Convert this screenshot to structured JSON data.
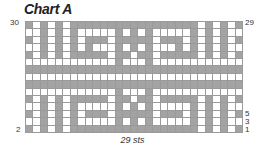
{
  "title": "Chart A",
  "labels": {
    "left_top": "30",
    "left_bottom": "2",
    "right_top": "29",
    "right_5": "5",
    "right_3": "3",
    "right_1": "1"
  },
  "footer": "29 sts",
  "colors": {
    "contrast": "#a3a3a3",
    "main": "#ffffff",
    "gridline": "#9a9a9a"
  },
  "chart_data": {
    "type": "heatmap",
    "title": "Chart A",
    "xlabel": "29 sts",
    "columns": 29,
    "rows": 15,
    "row_labels_left": [
      "30",
      "2"
    ],
    "row_labels_right": [
      "29",
      "5",
      "3",
      "1"
    ],
    "legend": {
      "1": "contrast color (grey)",
      "0": "main color (white)"
    },
    "grid": [
      "GWGWGWGGGGGGGGGGGGGGGGGWGWGWG",
      "WWGWGWGWWWWWGWGWGWWWWWGWGWGWW",
      "GWGWGWGWGGGWGGGGGWGGGWGWGWGWG",
      "WWGWGWGWGWWWGWGWGWWWGWGWGWGWW",
      "GWGWGWGGGGGWGGWGGWGGGGGWGWGWG",
      "WWWWWWWWWWWWGWWWGWWWWWWWWWWWW",
      "GGGGGGGGGGGGGGGGGGGGGGGGGGGGG",
      "WWWWWWWWWWWWWWWWWWWWWWWWWWWWW",
      "GGGGGGGGGGGGGGGGGGGGGGGGGGGGG",
      "WWWWWWWWWWWWGWWWGWWWWWWWWWWWW",
      "GWGWGWGGGGGWGGWGGWGGGGGWGWGWG",
      "WWGWGWGWWWWWGWGWGWWWWWGWGWGWW",
      "GWGWGWGWGGGWGGGGGWGGGWGWGWGWG",
      "WWGWGWGWWWWWGWGWGWWWWWGWGWGWW",
      "GWGWGWGGGGGGGGGGGGGGGGGWGWGWG"
    ]
  }
}
